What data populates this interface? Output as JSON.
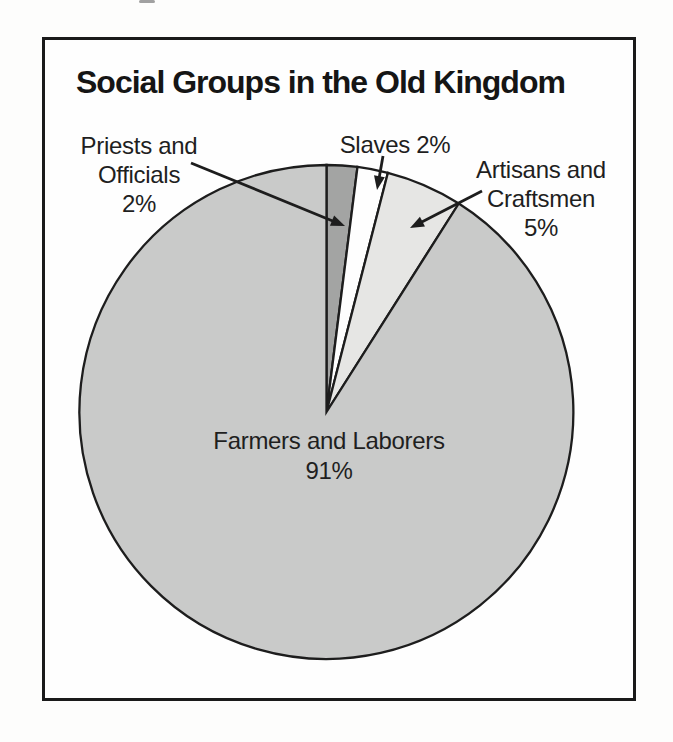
{
  "figure": {
    "title": "Social Groups in the Old Kingdom"
  },
  "chart_data": {
    "type": "pie",
    "title": "Social Groups in the Old Kingdom",
    "categories": [
      "Priests and Officials",
      "Slaves",
      "Artisans and Craftsmen",
      "Farmers and Laborers"
    ],
    "values": [
      2,
      2,
      5,
      91
    ],
    "unit": "percent",
    "direction": "clockwise",
    "start_angle": "12-o-clock",
    "slice_colors": [
      "#a3a4a3",
      "#fefefe",
      "#e6e6e4",
      "#c9cac9"
    ],
    "stroke_color": "#1d1d1d",
    "legend": "none",
    "label_style": "external callouts with arrows; largest slice labeled inside"
  },
  "callouts": {
    "priests": {
      "text": "Priests and\nOfficials\n2%"
    },
    "slaves": {
      "text": "Slaves 2%"
    },
    "artisans": {
      "text": "Artisans and\nCraftsmen\n5%"
    },
    "farmers": {
      "text": "Farmers and Laborers\n91%"
    }
  }
}
